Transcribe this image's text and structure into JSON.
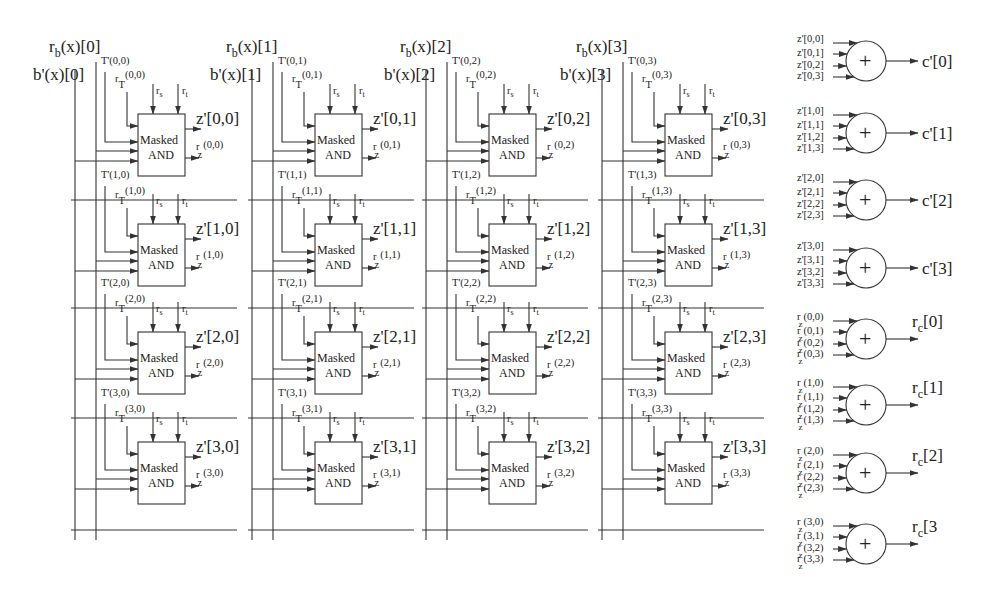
{
  "diagram": {
    "type": "masked polynomial multiplier architecture",
    "columns": [
      {
        "index": 0,
        "top_label_r": "r",
        "top_label_r_sub": "b",
        "top_label_r_rest": "(x)[0]",
        "top_label_b": "b'(x)[0]"
      },
      {
        "index": 1,
        "top_label_r": "r",
        "top_label_r_sub": "b",
        "top_label_r_rest": "(x)[1]",
        "top_label_b": "b'(x)[1]"
      },
      {
        "index": 2,
        "top_label_r": "r",
        "top_label_r_sub": "b",
        "top_label_r_rest": "(x)[2]",
        "top_label_b": "b'(x)[2]"
      },
      {
        "index": 3,
        "top_label_r": "r",
        "top_label_r_sub": "b",
        "top_label_r_rest": "(x)[3]",
        "top_label_b": "b'(x)[3]"
      }
    ],
    "masked_and": {
      "line1": "Masked",
      "line2": "AND",
      "input_rs": "r",
      "input_rs_sub": "s",
      "input_rt": "r",
      "input_rt_sub": "t"
    },
    "cells": [
      [
        {
          "T": "T'(0,0)",
          "rT": "(0,0)",
          "z": "z'[0,0]",
          "rz": "(0,0)"
        },
        {
          "T": "T'(1,0)",
          "rT": "(1,0)",
          "z": "z'[1,0]",
          "rz": "(1,0)"
        },
        {
          "T": "T'(2,0)",
          "rT": "(2,0)",
          "z": "z'[2,0]",
          "rz": "(2,0)"
        },
        {
          "T": "T'(3,0)",
          "rT": "(3,0)",
          "z": "z'[3,0]",
          "rz": "(3,0)"
        }
      ],
      [
        {
          "T": "T'(0,1)",
          "rT": "(0,1)",
          "z": "z'[0,1]",
          "rz": "(0,1)"
        },
        {
          "T": "T'(1,1)",
          "rT": "(1,1)",
          "z": "z'[1,1]",
          "rz": "(1,1)"
        },
        {
          "T": "T'(2,1)",
          "rT": "(2,1)",
          "z": "z'[2,1]",
          "rz": "(2,1)"
        },
        {
          "T": "T'(3,1)",
          "rT": "(3,1)",
          "z": "z'[3,1]",
          "rz": "(3,1)"
        }
      ],
      [
        {
          "T": "T'(0,2)",
          "rT": "(0,2)",
          "z": "z'[0,2]",
          "rz": "(0,2)"
        },
        {
          "T": "T'(1,2)",
          "rT": "(1,2)",
          "z": "z'[1,2]",
          "rz": "(1,2)"
        },
        {
          "T": "T'(2,2)",
          "rT": "(2,2)",
          "z": "z'[2,2]",
          "rz": "(2,2)"
        },
        {
          "T": "T'(3,2)",
          "rT": "(3,2)",
          "z": "z'[3,2]",
          "rz": "(3,2)"
        }
      ],
      [
        {
          "T": "T'(0,3)",
          "rT": "(0,3)",
          "z": "z'[0,3]",
          "rz": "(0,3)"
        },
        {
          "T": "T'(1,3)",
          "rT": "(1,3)",
          "z": "z'[1,3]",
          "rz": "(1,3)"
        },
        {
          "T": "T'(2,3)",
          "rT": "(2,3)",
          "z": "z'[2,3]",
          "rz": "(2,3)"
        },
        {
          "T": "T'(3,3)",
          "rT": "(3,3)",
          "z": "z'[3,3]",
          "rz": "(3,3)"
        }
      ]
    ],
    "xor_symbol": "+",
    "c_adders": [
      {
        "inputs": [
          "z'[0,0]",
          "z'[0,1]",
          "z'[0,2]",
          "z'[0,3]"
        ],
        "output": "c'[0]"
      },
      {
        "inputs": [
          "z'[1,0]",
          "z'[1,1]",
          "z'[1,2]",
          "z'[1,3]"
        ],
        "output": "c'[1]"
      },
      {
        "inputs": [
          "z'[2,0]",
          "z'[2,1]",
          "z'[2,2]",
          "z'[2,3]"
        ],
        "output": "c'[2]"
      },
      {
        "inputs": [
          "z'[3,0]",
          "z'[3,1]",
          "z'[3,2]",
          "z'[3,3]"
        ],
        "output": "c'[3]"
      }
    ],
    "r_adders": [
      {
        "inputs": [
          "(0,0)",
          "(0,1)",
          "(0,2)",
          "(0,3)"
        ],
        "output_r": "r",
        "output_sub": "c",
        "output_rest": "[0]"
      },
      {
        "inputs": [
          "(1,0)",
          "(1,1)",
          "(1,2)",
          "(1,3)"
        ],
        "output_r": "r",
        "output_sub": "c",
        "output_rest": "[1]"
      },
      {
        "inputs": [
          "(2,0)",
          "(2,1)",
          "(2,2)",
          "(2,3)"
        ],
        "output_r": "r",
        "output_sub": "c",
        "output_rest": "[2]"
      },
      {
        "inputs": [
          "(3,0)",
          "(3,1)",
          "(3,2)",
          "(3,3)"
        ],
        "output_r": "r",
        "output_sub": "c",
        "output_rest": "[3"
      }
    ],
    "r_prefix": "r",
    "z_sub": "z",
    "T_sub": "T"
  }
}
